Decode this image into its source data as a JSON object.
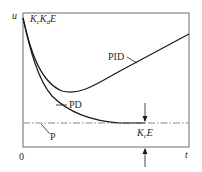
{
  "diagram": {
    "type": "response-curves",
    "axes": {
      "y_label": "u",
      "x_label": "t",
      "origin_label": "0"
    },
    "initial_value_label": {
      "K": "K",
      "c": "c",
      "K2": "K",
      "d": "d",
      "E": "E"
    },
    "steady_value_label": {
      "K": "K",
      "c": "c",
      "E": "E"
    },
    "curves": [
      {
        "name": "PID",
        "label": "PID",
        "description": "starts high, dips to minimum, then rises linearly"
      },
      {
        "name": "PD",
        "label": "PD",
        "description": "starts high, decays to P level"
      },
      {
        "name": "P",
        "label": "P",
        "description": "constant level (dash-dot line)"
      }
    ],
    "colors": {
      "line": "#1a1a1a",
      "frame": "#6a6a6a",
      "dashdot": "#8a8a8a"
    }
  }
}
